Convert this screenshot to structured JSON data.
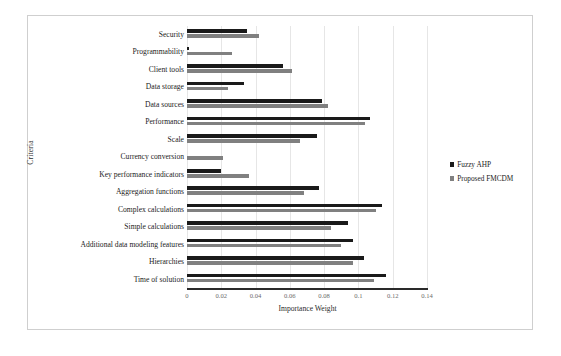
{
  "chart_data": {
    "type": "bar",
    "orientation": "horizontal",
    "title": "",
    "xlabel": "Importance Weight",
    "ylabel": "Criteria",
    "xlim": [
      0,
      0.14
    ],
    "xticks": [
      "0",
      "0.02",
      "0.04",
      "0.06",
      "0.08",
      "0.1",
      "0.12",
      "0.14"
    ],
    "xtick_values": [
      0,
      0.02,
      0.04,
      0.06,
      0.08,
      0.1,
      0.12,
      0.14
    ],
    "grid": "vertical",
    "legend_position": "right",
    "categories": [
      "Security",
      "Programmability",
      "Client tools",
      "Data storage",
      "Data sources",
      "Performance",
      "Scale",
      "Currency conversion",
      "Key performance indicators",
      "Aggregation functions",
      "Complex calculations",
      "Simple calculations",
      "Additional data modeling features",
      "Hierarchies",
      "Time of solution"
    ],
    "series": [
      {
        "name": "Fuzzy AHP",
        "color": "#1a1a1a",
        "values": [
          0.035,
          0.001,
          0.056,
          0.033,
          0.079,
          0.107,
          0.076,
          0.0,
          0.02,
          0.077,
          0.114,
          0.094,
          0.097,
          0.103,
          0.116
        ]
      },
      {
        "name": "Proposed FMCDM",
        "color": "#808080",
        "values": [
          0.042,
          0.026,
          0.061,
          0.024,
          0.082,
          0.104,
          0.066,
          0.021,
          0.036,
          0.068,
          0.11,
          0.084,
          0.09,
          0.097,
          0.109
        ]
      }
    ]
  },
  "legend": {
    "items": [
      {
        "label": "Fuzzy AHP",
        "color": "#1a1a1a",
        "marker": "square-marker"
      },
      {
        "label": "Proposed FMCDM",
        "color": "#808080",
        "marker": "square-marker"
      }
    ]
  },
  "axes": {
    "x_title": "Importance Weight",
    "y_title": "Criteria"
  }
}
